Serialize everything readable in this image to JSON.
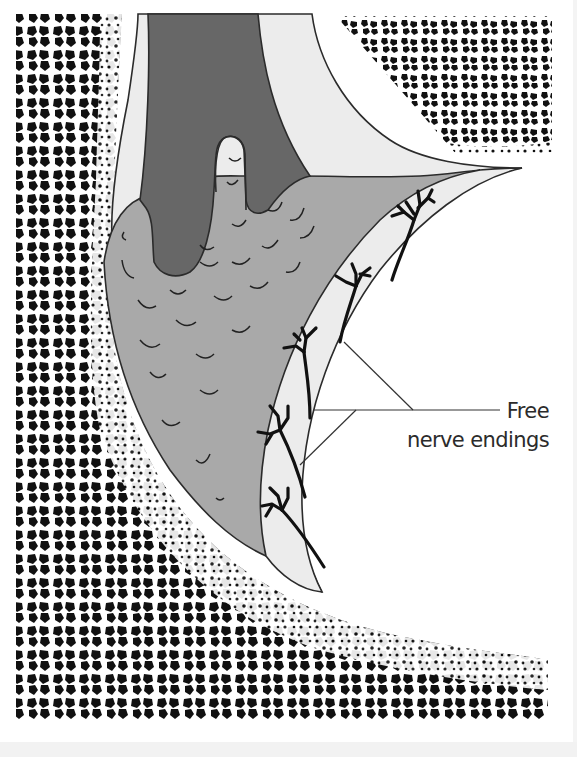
{
  "figure": {
    "type": "anatomical-diagram",
    "labels": [
      {
        "id": "free-nerve-endings",
        "line1": "Free",
        "line2": "nerve endings"
      }
    ],
    "colors": {
      "background": "#ffffff",
      "bone_trabeculae": "#111111",
      "capsule_light": "#ececec",
      "synovium_mid": "#a9a9a9",
      "fat_pad_dark": "#676767",
      "outline": "#2b2b2b",
      "nerve": "#111111"
    }
  }
}
